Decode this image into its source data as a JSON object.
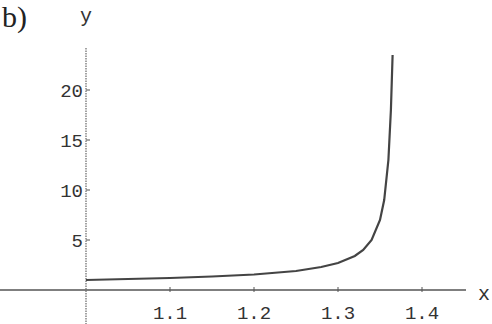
{
  "panel_label": "b)",
  "chart_data": {
    "type": "line",
    "title": "",
    "xlabel": "x",
    "ylabel": "y",
    "xlim": [
      1.0,
      1.45
    ],
    "ylim": [
      0,
      24
    ],
    "grid": false,
    "legend": null,
    "x_ticks": [
      "1.1",
      "1.2",
      "1.3",
      "1.4"
    ],
    "y_ticks": [
      "5",
      "10",
      "15",
      "20"
    ],
    "series": [
      {
        "name": "y(x)",
        "x": [
          1.0,
          1.05,
          1.1,
          1.15,
          1.2,
          1.25,
          1.28,
          1.3,
          1.32,
          1.33,
          1.34,
          1.35,
          1.355,
          1.36,
          1.363,
          1.365
        ],
        "y": [
          1.0,
          1.1,
          1.2,
          1.35,
          1.55,
          1.9,
          2.3,
          2.7,
          3.4,
          4.0,
          5.0,
          7.0,
          9.0,
          13.0,
          18.0,
          23.5
        ]
      }
    ],
    "color": "#444444"
  }
}
